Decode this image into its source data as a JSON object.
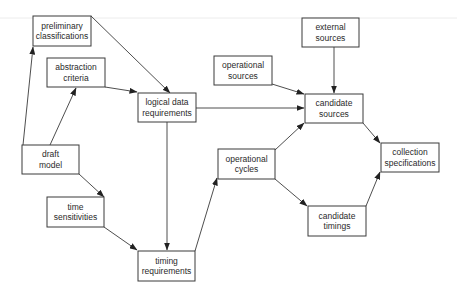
{
  "diagram": {
    "nodes": [
      {
        "id": "preliminary_classifications",
        "lines": [
          "preliminary",
          "classifications"
        ]
      },
      {
        "id": "abstraction_criteria",
        "lines": [
          "abstraction",
          "criteria"
        ]
      },
      {
        "id": "draft_model",
        "lines": [
          "draft",
          "model"
        ]
      },
      {
        "id": "time_sensitivities",
        "lines": [
          "time",
          "sensitivities"
        ]
      },
      {
        "id": "logical_data_requirements",
        "lines": [
          "logical data",
          "requirements"
        ]
      },
      {
        "id": "timing_requirements",
        "lines": [
          "timing",
          "requirements"
        ]
      },
      {
        "id": "operational_sources",
        "lines": [
          "operational",
          "sources"
        ]
      },
      {
        "id": "external_sources",
        "lines": [
          "external",
          "sources"
        ]
      },
      {
        "id": "candidate_sources",
        "lines": [
          "candidate",
          "sources"
        ]
      },
      {
        "id": "operational_cycles",
        "lines": [
          "operational",
          "cycles"
        ]
      },
      {
        "id": "candidate_timings",
        "lines": [
          "candidate",
          "timings"
        ]
      },
      {
        "id": "collection_specifications",
        "lines": [
          "collection",
          "specifications"
        ]
      }
    ],
    "edges": [
      {
        "from": "draft_model",
        "to": "preliminary_classifications"
      },
      {
        "from": "draft_model",
        "to": "abstraction_criteria"
      },
      {
        "from": "draft_model",
        "to": "time_sensitivities"
      },
      {
        "from": "preliminary_classifications",
        "to": "logical_data_requirements"
      },
      {
        "from": "abstraction_criteria",
        "to": "logical_data_requirements"
      },
      {
        "from": "logical_data_requirements",
        "to": "candidate_sources"
      },
      {
        "from": "logical_data_requirements",
        "to": "timing_requirements"
      },
      {
        "from": "time_sensitivities",
        "to": "timing_requirements"
      },
      {
        "from": "timing_requirements",
        "to": "operational_cycles"
      },
      {
        "from": "operational_sources",
        "to": "candidate_sources"
      },
      {
        "from": "external_sources",
        "to": "candidate_sources"
      },
      {
        "from": "operational_cycles",
        "to": "candidate_sources"
      },
      {
        "from": "operational_cycles",
        "to": "candidate_timings"
      },
      {
        "from": "candidate_sources",
        "to": "collection_specifications"
      },
      {
        "from": "candidate_timings",
        "to": "collection_specifications"
      }
    ]
  }
}
